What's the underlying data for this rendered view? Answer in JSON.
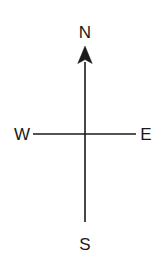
{
  "figure": {
    "name": "compass-rose",
    "background_color": "#ffffff",
    "stroke_color": "#1a1a1a",
    "text_color": "#1a1a1a",
    "width": 160,
    "height": 270
  },
  "labels": {
    "north": "N",
    "south": "S",
    "east": "E",
    "west": "W"
  },
  "geometry": {
    "center_x": 85,
    "center_y": 134,
    "vertical_top": 46,
    "vertical_bottom": 222,
    "horizontal_left": 33,
    "horizontal_right": 136,
    "arrow_tip_y": 46,
    "arrow_base_y": 62,
    "arrow_half_width": 7,
    "stroke_width": 1.6
  },
  "label_positions": {
    "north": {
      "x": 85,
      "y": 38
    },
    "south": {
      "x": 85,
      "y": 250
    },
    "west": {
      "x": 22,
      "y": 140
    },
    "east": {
      "x": 146,
      "y": 140
    }
  }
}
